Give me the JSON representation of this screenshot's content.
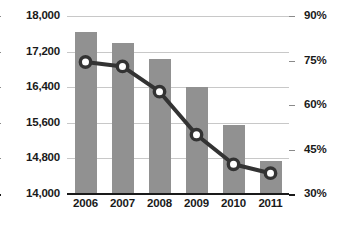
{
  "chart_data": {
    "type": "bar",
    "title": "",
    "subtitle": "",
    "xlabel": "",
    "categories": [
      "2006",
      "2007",
      "2008",
      "2009",
      "2010",
      "2011"
    ],
    "grid": true,
    "legend": false,
    "series": [
      {
        "name": "Count",
        "type": "bar",
        "axis": "left",
        "color": "#919191",
        "values": [
          17650,
          17400,
          17030,
          16400,
          15550,
          14740
        ]
      },
      {
        "name": "Percent",
        "type": "line",
        "axis": "right",
        "color": "#333333",
        "marker": "circle-open",
        "values": [
          74.5,
          73.0,
          64.5,
          50.0,
          40.0,
          37.0
        ]
      }
    ],
    "left_axis": {
      "label": "",
      "ylim": [
        14000,
        18000
      ],
      "ticks": [
        18000,
        17200,
        16400,
        15600,
        14800,
        14000
      ],
      "tick_labels": [
        "18,000",
        "17,200",
        "16,400",
        "15,600",
        "14,800",
        "14,000"
      ]
    },
    "right_axis": {
      "label": "",
      "ylim": [
        30,
        90
      ],
      "ticks": [
        90,
        75,
        60,
        45,
        30
      ],
      "tick_labels": [
        "90%",
        "75%",
        "60%",
        "45%",
        "30%"
      ]
    }
  },
  "style": {
    "background": "#ffffff",
    "bar_color": "#919191",
    "line_color": "#333333",
    "marker_fill": "#ffffff",
    "gridline_color": "#c8c8c8",
    "axis_color": "#1a1a1a"
  }
}
